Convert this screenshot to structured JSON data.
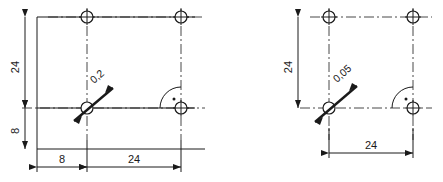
{
  "drawing": {
    "title": "Hole pattern positional tolerance comparison",
    "units": "mm",
    "line_color": "#1a1a1a",
    "background": "#ffffff",
    "figures": [
      {
        "id": "left",
        "name": "figure-left",
        "tolerance_label": "0,2",
        "dimensions": [
          {
            "name": "vertical-24",
            "value": "24",
            "orientation": "vertical"
          },
          {
            "name": "vertical-8",
            "value": "8",
            "orientation": "vertical"
          },
          {
            "name": "horizontal-8",
            "value": "8",
            "orientation": "horizontal"
          },
          {
            "name": "horizontal-24",
            "value": "24",
            "orientation": "horizontal"
          }
        ],
        "holes": 3,
        "has_outline": true,
        "right_angle_symbol": true
      },
      {
        "id": "right",
        "name": "figure-right",
        "tolerance_label": "0,05",
        "dimensions": [
          {
            "name": "vertical-24",
            "value": "24",
            "orientation": "vertical"
          },
          {
            "name": "horizontal-24",
            "value": "24",
            "orientation": "horizontal"
          }
        ],
        "holes": 3,
        "has_outline": false,
        "right_angle_symbol": true
      }
    ]
  }
}
